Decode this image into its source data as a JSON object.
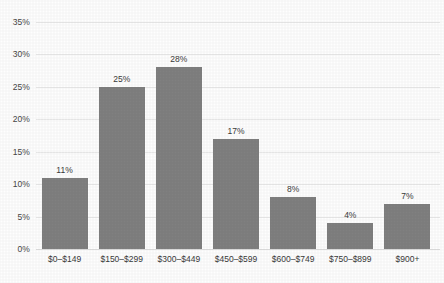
{
  "chart_data": {
    "type": "bar",
    "title": "",
    "subtitle": "",
    "xlabel": "",
    "ylabel": "",
    "categories": [
      "$0–$149",
      "$150–$299",
      "$300–$449",
      "$450–$599",
      "$600–$749",
      "$750–$899",
      "$900+"
    ],
    "values": [
      11,
      25,
      28,
      17,
      8,
      4,
      7
    ],
    "value_labels": [
      "11%",
      "25%",
      "28%",
      "17%",
      "8%",
      "4%",
      "7%"
    ],
    "ylim": [
      0,
      35
    ],
    "ytick_values": [
      0,
      5,
      10,
      15,
      20,
      25,
      30,
      35
    ],
    "ytick_labels": [
      "0%",
      "5%",
      "10%",
      "15%",
      "20%",
      "25%",
      "30%",
      "35%"
    ],
    "grid": true,
    "grid_axis": "y",
    "legend": false,
    "legend_position": "none",
    "bar_color": "#808080",
    "grid_color": "#e9e9e9",
    "text_color": "#3a3a3a",
    "background_color": "#fefefe"
  }
}
